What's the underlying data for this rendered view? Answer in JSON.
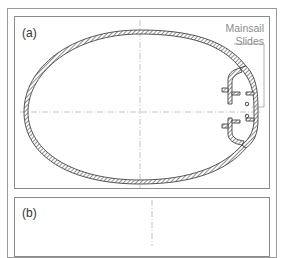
{
  "figure": {
    "panels": [
      {
        "id": "a",
        "label": "(a)"
      },
      {
        "id": "b",
        "label": "(b)"
      }
    ],
    "callout": {
      "line1": "Mainsail",
      "line2": "Slides"
    }
  },
  "colors": {
    "frame": "#9a9a9a",
    "panel_border": "#8a8a8a",
    "hatch": "#555555",
    "centerline": "#b5b5b5",
    "callout_text": "#8c8c8c",
    "label_text": "#333333"
  }
}
